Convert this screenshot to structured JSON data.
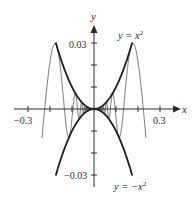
{
  "chart_data": {
    "type": "line",
    "title": "",
    "xlabel": "x",
    "ylabel": "y",
    "xlim": [
      -0.36,
      0.39
    ],
    "ylim": [
      -0.035,
      0.039
    ],
    "grid": false,
    "x_ticks": [
      -0.3,
      -0.2,
      -0.1,
      0.1,
      0.2,
      0.3
    ],
    "x_tick_labels": [
      {
        "value": -0.3,
        "label": "−0.3"
      },
      {
        "value": 0.3,
        "label": "0.3"
      }
    ],
    "y_ticks": [
      -0.03,
      -0.02,
      -0.01,
      0.01,
      0.02,
      0.03
    ],
    "y_tick_labels": [
      {
        "value": 0.03,
        "label": "0.03"
      },
      {
        "value": -0.03,
        "label": "−0.03"
      }
    ],
    "series": [
      {
        "name": "upper envelope",
        "label": "y = x²",
        "formula": "y = x^2",
        "domain": [
          -0.174,
          0.174
        ],
        "color": "#1e1e1e"
      },
      {
        "name": "lower envelope",
        "label": "y = −x²",
        "formula": "y = -x^2",
        "domain": [
          -0.174,
          0.174
        ],
        "color": "#1e1e1e"
      },
      {
        "name": "oscillating curve",
        "formula": "y = x^2 cos(1.056/x)",
        "domain": [
          -0.236,
          0.236
        ],
        "color": "#8a8a8a"
      }
    ],
    "annotations": [
      {
        "text": "y = x²",
        "near": [
          0.17,
          0.03
        ]
      },
      {
        "text": "y = −x²",
        "near": [
          0.17,
          -0.035
        ]
      }
    ]
  },
  "labels": {
    "x_axis": "x",
    "y_axis": "y",
    "x_neg": "−0.3",
    "x_pos": "0.3",
    "y_pos": "0.03",
    "y_neg": "−0.03",
    "upper_curve_prefix": "y = x",
    "lower_curve_prefix": "y = −x",
    "exponent": "2"
  },
  "colors": {
    "axis": "#2a2a2a",
    "envelope": "#1e1e1e",
    "oscillation": "#8a8a8a"
  }
}
